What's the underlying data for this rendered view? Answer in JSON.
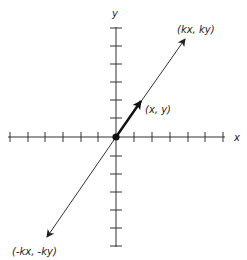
{
  "diagram": {
    "axes": {
      "x_label": "x",
      "y_label": "y",
      "origin_px": [
        116,
        137
      ],
      "tick_spacing_px": 18,
      "x_ticks_left": 6,
      "x_ticks_right": 6,
      "y_ticks_up": 6,
      "y_ticks_down": 6
    },
    "vectors": [
      {
        "name": "unit-vector",
        "label": "(x, y)",
        "bold": true
      },
      {
        "name": "scaled-vector",
        "label": "(kx, ky)"
      },
      {
        "name": "negated-scaled-vector",
        "label": "(-kx, -ky)"
      }
    ],
    "colors": {
      "stroke": "#222222",
      "background": "#ffffff"
    }
  }
}
